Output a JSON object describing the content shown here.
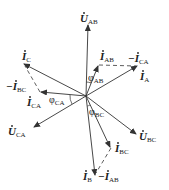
{
  "diagram": {
    "type": "phasor-diagram",
    "origin": [
      86,
      96
    ],
    "colors": {
      "line": "#333333",
      "text": "#222222",
      "background": "#ffffff"
    },
    "phasors": [
      {
        "id": "U_AB",
        "kind": "voltage",
        "to": [
          88,
          24
        ],
        "label": "U",
        "sub": "AB",
        "dot": true
      },
      {
        "id": "U_BC",
        "kind": "voltage",
        "to": [
          137,
          135
        ],
        "label": "U",
        "sub": "BC",
        "dot": true
      },
      {
        "id": "U_CA",
        "kind": "voltage",
        "to": [
          33,
          128
        ],
        "label": "U",
        "sub": "CA",
        "dot": true
      },
      {
        "id": "I_A",
        "kind": "current",
        "to": [
          138,
          66
        ],
        "label": "I",
        "sub": "A",
        "dot": true
      },
      {
        "id": "I_B",
        "kind": "current",
        "to": [
          95,
          176
        ],
        "label": "I",
        "sub": "B",
        "dot": true
      },
      {
        "id": "I_C",
        "kind": "current",
        "to": [
          23,
          63
        ],
        "label": "I",
        "sub": "C",
        "dot": true
      },
      {
        "id": "I_AB",
        "kind": "current",
        "to": [
          98,
          65
        ],
        "label": "I",
        "sub": "AB",
        "dot": true
      },
      {
        "id": "I_BC",
        "kind": "current",
        "to": [
          111,
          148
        ],
        "label": "I",
        "sub": "BC",
        "dot": true
      },
      {
        "id": "I_CA",
        "kind": "current",
        "to": [
          40,
          92
        ],
        "label": "I",
        "sub": "CA",
        "dot": true
      }
    ],
    "dashed": [
      {
        "id": "neg_I_CA",
        "from": [
          98,
          65
        ],
        "to": [
          138,
          66
        ],
        "label": "−I",
        "sub": "CA"
      },
      {
        "id": "neg_I_BC",
        "from": [
          40,
          92
        ],
        "to": [
          23,
          63
        ],
        "label": "−I",
        "sub": "BC"
      },
      {
        "id": "neg_I_AB",
        "from": [
          111,
          148
        ],
        "to": [
          95,
          176
        ],
        "label": "−I",
        "sub": "AB"
      }
    ],
    "angles": [
      {
        "id": "phi_AB",
        "label": "φ",
        "sub": "AB"
      },
      {
        "id": "phi_BC",
        "label": "φ",
        "sub": "BC"
      },
      {
        "id": "phi_CA",
        "label": "φ",
        "sub": "CA"
      }
    ]
  }
}
